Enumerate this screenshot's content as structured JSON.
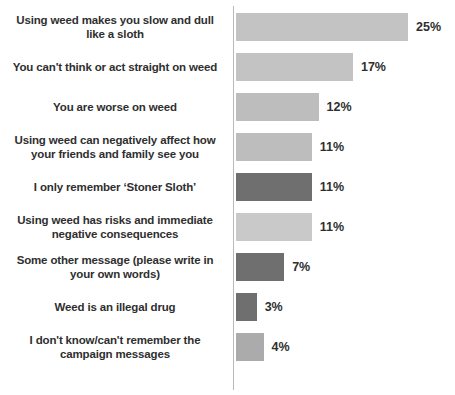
{
  "chart_data": {
    "type": "bar",
    "orientation": "horizontal",
    "title": "",
    "subtitle": "",
    "xlabel": "",
    "ylabel": "",
    "grid": false,
    "legend": "none",
    "xlim": [
      0,
      28
    ],
    "value_suffix": "%",
    "categories": [
      "Using weed makes you slow and dull like a sloth",
      "You can't think or act straight on weed",
      "You are worse on weed",
      "Using weed can negatively affect how your friends and family see you",
      "I only remember ‘Stoner Sloth’",
      "Using weed has risks and immediate negative consequences",
      "Some other message (please write in your own words)",
      "Weed is an illegal drug",
      "I don't know/can't remember the campaign messages"
    ],
    "values": [
      25,
      17,
      12,
      11,
      11,
      11,
      7,
      3,
      4
    ],
    "value_labels": [
      "25%",
      "17%",
      "12%",
      "11%",
      "11%",
      "11%",
      "7%",
      "3%",
      "4%"
    ],
    "colors": {
      "light_gray": "#c3c3c3",
      "mid_gray": "#b0b0b0",
      "dark_gray": "#6f6f6f",
      "axis": "#b9b9b9",
      "text": "#2f2f2f",
      "background": "#ffffff"
    },
    "bars": [
      {
        "label_lines": [
          "Using weed makes you slow and dull",
          "like a sloth"
        ],
        "value": 25,
        "value_label": "25%",
        "color": "#c3c3c3"
      },
      {
        "label_lines": [
          "You can't think or act straight on weed"
        ],
        "value": 17,
        "value_label": "17%",
        "color": "#c3c3c3"
      },
      {
        "label_lines": [
          "You are worse on weed"
        ],
        "value": 12,
        "value_label": "12%",
        "color": "#bdbdbd"
      },
      {
        "label_lines": [
          "Using weed can negatively affect how",
          "your friends and family see you"
        ],
        "value": 11,
        "value_label": "11%",
        "color": "#bdbdbd"
      },
      {
        "label_lines": [
          "I only remember ‘Stoner Sloth’"
        ],
        "value": 11,
        "value_label": "11%",
        "color": "#6f6f6f"
      },
      {
        "label_lines": [
          "Using weed has risks and immediate",
          "negative consequences"
        ],
        "value": 11,
        "value_label": "11%",
        "color": "#c9c9c9"
      },
      {
        "label_lines": [
          "Some other message (please write in",
          "your own words)"
        ],
        "value": 7,
        "value_label": "7%",
        "color": "#6f6f6f"
      },
      {
        "label_lines": [
          "Weed is an illegal drug"
        ],
        "value": 3,
        "value_label": "3%",
        "color": "#6f6f6f"
      },
      {
        "label_lines": [
          "I don't know/can't remember the",
          "campaign messages"
        ],
        "value": 4,
        "value_label": "4%",
        "color": "#ababab"
      }
    ]
  }
}
